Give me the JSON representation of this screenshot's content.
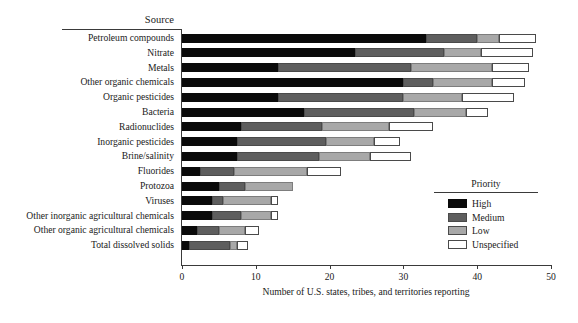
{
  "chart_data": {
    "type": "bar",
    "orientation": "horizontal",
    "stacked": true,
    "title": "",
    "xlabel": "Number of U.S. states, tribes, and territories reporting",
    "ylabel": "Source",
    "xlim": [
      0,
      50
    ],
    "xticks": [
      0,
      10,
      20,
      30,
      40,
      50
    ],
    "grid": false,
    "legend": {
      "title": "Priority",
      "position": "inside-right",
      "entries": [
        {
          "name": "High",
          "color": "#0a0a0a"
        },
        {
          "name": "Medium",
          "color": "#5e5e5e"
        },
        {
          "name": "Low",
          "color": "#a8a8a8"
        },
        {
          "name": "Unspecified",
          "color": "#ffffff"
        }
      ]
    },
    "categories": [
      "Petroleum compounds",
      "Nitrate",
      "Metals",
      "Other organic chemicals",
      "Organic pesticides",
      "Bacteria",
      "Radionuclides",
      "Inorganic pesticides",
      "Brine/salinity",
      "Fluorides",
      "Protozoa",
      "Viruses",
      "Other inorganic agricultural chemicals",
      "Other organic agricultural chemicals",
      "Total dissolved solids"
    ],
    "series": [
      {
        "name": "High",
        "values": [
          33,
          23.5,
          13,
          30,
          13,
          16.5,
          8,
          7.5,
          7.5,
          2.5,
          5,
          4,
          4,
          2,
          1
        ]
      },
      {
        "name": "Medium",
        "values": [
          7,
          12,
          18,
          4,
          17,
          15,
          11,
          12,
          11,
          4.5,
          3.5,
          1.5,
          4,
          3,
          5.5
        ]
      },
      {
        "name": "Low",
        "values": [
          3,
          5,
          11,
          8,
          8,
          7,
          9,
          6.5,
          7,
          10,
          6.5,
          6.5,
          4,
          3.5,
          1
        ]
      },
      {
        "name": "Unspecified",
        "values": [
          5,
          7,
          5,
          4.5,
          7,
          3,
          6,
          3.5,
          5.5,
          4.5,
          0,
          1,
          1,
          2,
          1.5
        ]
      }
    ],
    "totals": [
      48,
      47.5,
      47,
      46.5,
      45,
      41.5,
      34,
      29.5,
      31,
      21.5,
      15,
      13,
      13,
      10.5,
      9
    ]
  },
  "axis": {
    "source_header": "Source",
    "xtick_labels": [
      "0",
      "10",
      "20",
      "30",
      "40",
      "50"
    ],
    "x_title": "Number of U.S. states, tribes, and territories reporting"
  }
}
